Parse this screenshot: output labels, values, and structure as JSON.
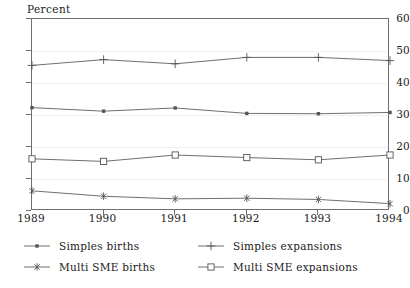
{
  "chart_data": {
    "type": "line",
    "title": "",
    "subtitle": "",
    "xlabel": "",
    "ylabel": "Percent",
    "categories": [
      "1989",
      "1990",
      "1991",
      "1992",
      "1993",
      "1994"
    ],
    "x": [
      1989,
      1990,
      1991,
      1992,
      1993,
      1994
    ],
    "xlim": [
      1989,
      1994
    ],
    "ylim": [
      0,
      60
    ],
    "yticks": [
      0,
      10,
      20,
      30,
      40,
      50,
      60
    ],
    "ytick_labels": [
      "0",
      "10",
      "20",
      "30",
      "40",
      "50",
      "60"
    ],
    "xtick_labels": [
      "1989",
      "1990",
      "1991",
      "1992",
      "1993",
      "1994"
    ],
    "grid": true,
    "grid_axis": "y",
    "legend_position": "below",
    "legend_columns": 2,
    "series": [
      {
        "name": "Simples births",
        "marker": "filled-square-dot",
        "color": "#555555",
        "values": [
          32.3,
          31.2,
          32.2,
          30.5,
          30.4,
          30.8
        ]
      },
      {
        "name": "Multi SME births",
        "marker": "asterisk",
        "color": "#555555",
        "values": [
          6.3,
          4.6,
          3.8,
          4.0,
          3.6,
          2.3
        ]
      },
      {
        "name": "Simples expansions",
        "marker": "plus",
        "color": "#555555",
        "values": [
          45.5,
          47.3,
          46.0,
          48.0,
          48.0,
          47.0
        ]
      },
      {
        "name": "Multi SME expansions",
        "marker": "open-square",
        "color": "#555555",
        "values": [
          16.3,
          15.5,
          17.5,
          16.7,
          16.0,
          17.5
        ]
      }
    ]
  },
  "legend": {
    "items": [
      {
        "label": "Simples births",
        "marker": "filled-square-dot"
      },
      {
        "label": "Multi SME births",
        "marker": "asterisk"
      },
      {
        "label": "Simples expansions",
        "marker": "plus"
      },
      {
        "label": "Multi SME expansions",
        "marker": "open-square"
      }
    ]
  },
  "colors": {
    "line": "#555555",
    "axis": "#6f6f6f",
    "grid": "#f0f0f0",
    "text": "#1a1a1a",
    "background": "#ffffff"
  }
}
